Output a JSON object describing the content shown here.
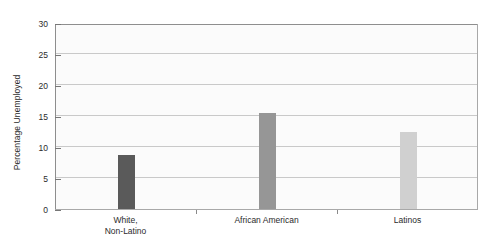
{
  "chart_data": {
    "type": "bar",
    "title": "",
    "xlabel": "",
    "ylabel": "Percentage Unemployed",
    "categories": [
      "White,\nNon-Latino",
      "African American",
      "Latinos"
    ],
    "values": [
      8.7,
      15.5,
      12.5
    ],
    "ylim": [
      0,
      30
    ],
    "yticks": [
      0,
      5,
      10,
      15,
      20,
      25,
      30
    ],
    "ytick_labels": [
      "0",
      "5",
      "10",
      "15",
      "20",
      "25",
      "30"
    ],
    "grid": true,
    "legend": "none",
    "bar_colors": [
      "#5a5a5a",
      "#969696",
      "#d0d0d0"
    ],
    "plot_background": "#fbfbfb",
    "gridline_color": "#c9c9c9",
    "axis_color": "#8e8e8e"
  }
}
